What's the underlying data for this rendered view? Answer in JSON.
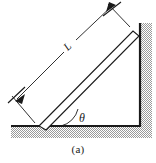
{
  "figure": {
    "caption": "(a)",
    "labels": {
      "length": "L",
      "angle": "θ"
    },
    "colors": {
      "stroke": "#1a1a1a",
      "hatch": "#9a9a9a",
      "background": "#ffffff",
      "thin_stroke": "#333333"
    },
    "geometry": {
      "ground_y": 126,
      "ground_x_start": 11,
      "ground_x_end": 141,
      "wall_x": 140,
      "wall_y_top": 23,
      "rod_angle_label": "θ"
    }
  }
}
